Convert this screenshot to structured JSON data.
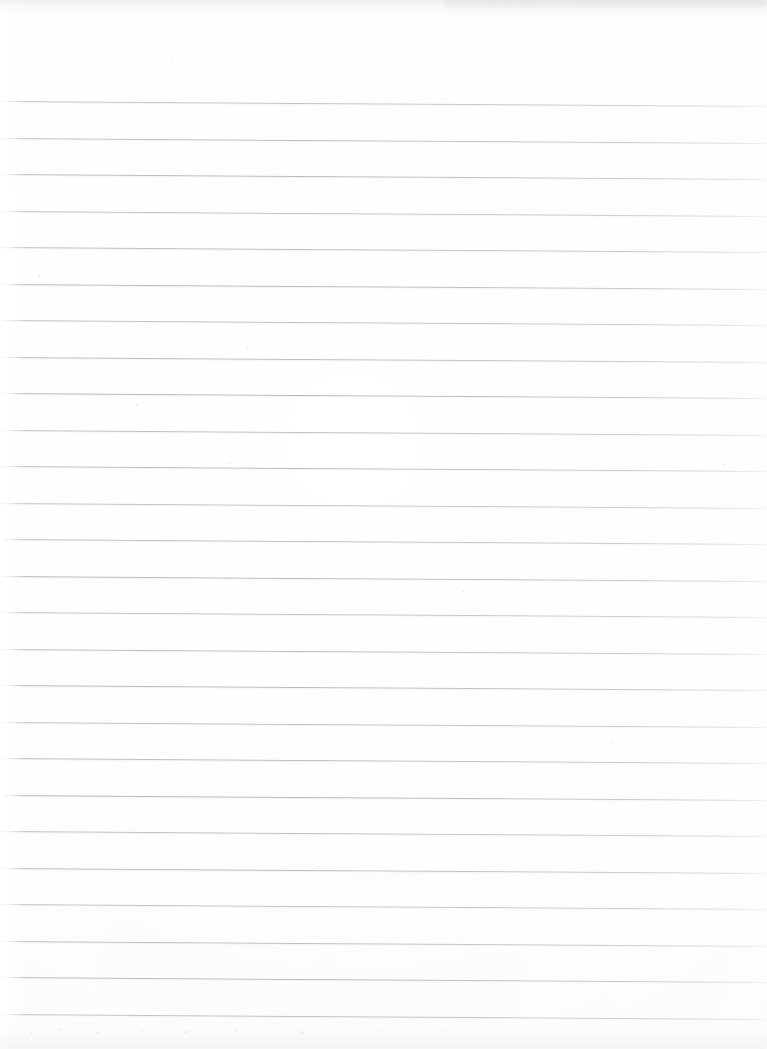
{
  "document": {
    "kind": "scanned-lined-paper",
    "title": "Blank ruled notebook page",
    "page_width": 767,
    "page_height": 1049,
    "visible_text": "",
    "handwriting_present": false,
    "printed_text_present": false
  },
  "paper": {
    "background_color": "#fdfdfd",
    "edge_glare_color": "#ffffff",
    "top_smudge_color": "#c4c6ca",
    "bottom_smudge_color": "#d2d4d8",
    "grain_color": "#e6e7ea"
  },
  "ruling": {
    "line_color": "#b3b6bb",
    "line_halo_color": "#e2e4e7",
    "line_thickness_px": 1,
    "line_count": 26,
    "first_line_y": 101,
    "line_spacing_px": 36.5,
    "last_line_y": 1012,
    "slant_drop_px": 5,
    "slant_degrees": 0.37,
    "left_inset_px": 0,
    "right_inset_px": 0,
    "top_margin_px": 101,
    "bottom_margin_px": 37,
    "margin_rule_present": false,
    "line_y_positions": [
      101,
      137.5,
      174,
      210.5,
      247,
      283.5,
      320,
      356.5,
      393,
      429.5,
      466,
      502.5,
      539,
      575.5,
      612,
      648.5,
      685,
      721.5,
      758,
      794.5,
      831,
      867.5,
      904,
      940.5,
      977,
      1013.5
    ]
  },
  "specks": [
    {
      "x": 38,
      "y": 275,
      "size": 2.0,
      "color": "rgba(196,198,202,0.45)"
    },
    {
      "x": 246,
      "y": 348,
      "size": 2.4,
      "color": "rgba(200,202,206,0.40)"
    },
    {
      "x": 136,
      "y": 404,
      "size": 2.2,
      "color": "rgba(194,196,200,0.42)"
    },
    {
      "x": 229,
      "y": 462,
      "size": 1.8,
      "color": "rgba(204,206,210,0.36)"
    },
    {
      "x": 723,
      "y": 464,
      "size": 2.0,
      "color": "rgba(202,204,208,0.34)"
    },
    {
      "x": 462,
      "y": 590,
      "size": 1.8,
      "color": "rgba(206,208,212,0.32)"
    },
    {
      "x": 612,
      "y": 742,
      "size": 2.0,
      "color": "rgba(203,205,209,0.30)"
    },
    {
      "x": 318,
      "y": 866,
      "size": 1.8,
      "color": "rgba(205,207,211,0.30)"
    },
    {
      "x": 170,
      "y": 58,
      "size": 2.2,
      "color": "rgba(214,216,220,0.34)"
    }
  ]
}
